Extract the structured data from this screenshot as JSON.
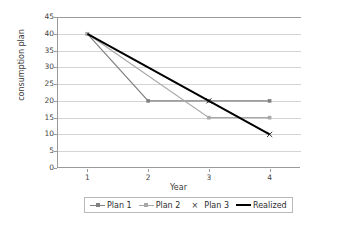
{
  "chart_data": {
    "type": "line",
    "title": "",
    "xlabel": "Year",
    "ylabel": "consumption plan",
    "x": [
      1,
      2,
      3,
      4
    ],
    "xticklabels": [
      "1",
      "2",
      "3",
      "4"
    ],
    "xlim": [
      0.5,
      4.5
    ],
    "ylim": [
      0,
      45
    ],
    "yticks": [
      0,
      5,
      10,
      15,
      20,
      25,
      30,
      35,
      40,
      45
    ],
    "yticklabels": [
      "0",
      "5",
      "10",
      "15",
      "20",
      "25",
      "30",
      "35",
      "40",
      "45"
    ],
    "grid": "horizontal",
    "legend_position": "bottom",
    "series": [
      {
        "name": "Plan 1",
        "values": [
          40,
          20,
          20,
          20
        ],
        "color": "#808080",
        "marker": "square",
        "line": "solid",
        "width": 1.2
      },
      {
        "name": "Plan 2",
        "values": [
          40,
          null,
          15,
          15
        ],
        "color": "#a8a8a8",
        "marker": "square",
        "line": "solid",
        "width": 1.2
      },
      {
        "name": "Plan 3",
        "values": [
          null,
          null,
          20,
          10
        ],
        "color": "#333333",
        "marker": "x",
        "line": "none",
        "width": 0
      },
      {
        "name": "Realized",
        "values": [
          40,
          30,
          20,
          10
        ],
        "color": "#000000",
        "marker": "none",
        "line": "solid",
        "width": 2.0
      }
    ]
  },
  "axes": {
    "y_title": "consumption plan",
    "x_title": "Year",
    "y_ticks": [
      "45",
      "40",
      "35",
      "30",
      "25",
      "20",
      "15",
      "10",
      "5",
      "0"
    ],
    "x_ticks": [
      "1",
      "2",
      "3",
      "4"
    ]
  },
  "legend": {
    "items": [
      {
        "label": "Plan 1",
        "swatch": "line-square-marker",
        "color": "#808080"
      },
      {
        "label": "Plan 2",
        "swatch": "line-square-marker",
        "color": "#a8a8a8"
      },
      {
        "label": "Plan 3",
        "swatch": "x-marker",
        "color": "#333333"
      },
      {
        "label": "Realized",
        "swatch": "thick-line",
        "color": "#000000"
      }
    ]
  },
  "colors": {
    "background": "#ffffff",
    "gridline": "#d4d4d4",
    "axis": "#9a9a9a",
    "text": "#3a3a3a"
  }
}
